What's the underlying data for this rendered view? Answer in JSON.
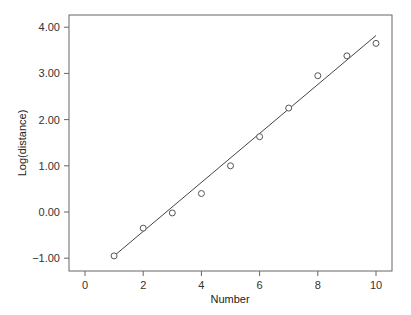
{
  "chart_data": {
    "type": "scatter",
    "title": "",
    "xlabel": "Number",
    "ylabel": "Log(distance)",
    "xlim": [
      -0.5,
      10.5
    ],
    "ylim": [
      -1.3,
      4.4
    ],
    "xticks": [
      0,
      2,
      4,
      6,
      8,
      10
    ],
    "xtick_labels": [
      "0",
      "2",
      "4",
      "6",
      "8",
      "10"
    ],
    "yticks": [
      -1,
      0,
      1,
      2,
      3,
      4
    ],
    "ytick_labels": [
      "-1.00",
      "0.00",
      "1.00",
      "2.00",
      "3.00",
      "4.00"
    ],
    "grid": false,
    "legend": null,
    "series": [
      {
        "name": "observed",
        "marker": "open-circle",
        "x": [
          1,
          2,
          3,
          4,
          5,
          6,
          7,
          8,
          9,
          10
        ],
        "y": [
          -0.95,
          -0.35,
          -0.02,
          0.4,
          1.0,
          1.63,
          2.25,
          2.95,
          3.38,
          3.65
        ]
      },
      {
        "name": "fitted line",
        "style": "line",
        "x": [
          1,
          10
        ],
        "y": [
          -0.95,
          3.82
        ]
      }
    ]
  }
}
